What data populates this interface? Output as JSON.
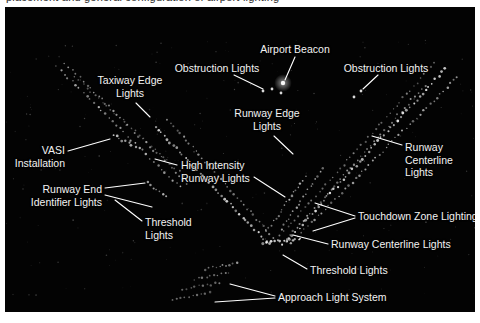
{
  "figure": {
    "top_cropped_text": "placement and general configuration of airport lighting",
    "background_color": "#ffffff",
    "photo_color": "#030303",
    "label_color": "#f2f2f2",
    "leader_color": "#ffffff"
  },
  "annotations": [
    {
      "id": "taxiway-edge-lights",
      "text": "Taxiway Edge\nLights",
      "align": "center",
      "x": 125,
      "y": 67,
      "leader": [
        [
          131,
          96
        ],
        [
          145,
          110
        ]
      ]
    },
    {
      "id": "obstruction-lights-left",
      "text": "Obstruction Lights",
      "align": "center",
      "x": 212,
      "y": 55,
      "leader": [
        [
          229,
          68
        ],
        [
          258,
          82
        ]
      ]
    },
    {
      "id": "airport-beacon",
      "text": "Airport Beacon",
      "align": "center",
      "x": 290,
      "y": 36,
      "leader": [
        [
          290,
          50
        ],
        [
          280,
          73
        ]
      ]
    },
    {
      "id": "obstruction-lights-right",
      "text": "Obstruction Lights",
      "align": "center",
      "x": 381,
      "y": 55,
      "leader": [
        [
          373,
          68
        ],
        [
          358,
          82
        ]
      ]
    },
    {
      "id": "runway-edge-lights",
      "text": "Runway Edge\nLights",
      "align": "center",
      "x": 262,
      "y": 100,
      "leader": [
        [
          269,
          129
        ],
        [
          288,
          147
        ]
      ]
    },
    {
      "id": "vasi-installation",
      "text": "VASI\nInstallation",
      "align": "right",
      "x": 60,
      "y": 137,
      "leader": [
        [
          63,
          144
        ],
        [
          105,
          132
        ]
      ]
    },
    {
      "id": "high-intensity-runway-lights",
      "text": "High Intensity\nRunway Lights",
      "align": "left",
      "x": 176,
      "y": 152,
      "leader": [
        [
          172,
          158
        ],
        [
          150,
          152
        ]
      ]
    },
    {
      "id": "high-intensity-runway-lights-right-leader",
      "text": "",
      "align": "left",
      "x": 0,
      "y": 0,
      "leader": [
        [
          249,
          170
        ],
        [
          280,
          190
        ]
      ]
    },
    {
      "id": "runway-centerline-lights-right",
      "text": "Runway\nCenterline\nLights",
      "align": "left",
      "x": 400,
      "y": 134,
      "leader": [
        [
          397,
          138
        ],
        [
          367,
          129
        ]
      ]
    },
    {
      "id": "runway-end-identifier-lights",
      "text": "Runway End\nIdentifier Lights",
      "align": "right",
      "x": 97,
      "y": 176,
      "leader": [
        [
          100,
          181
        ],
        [
          140,
          176
        ]
      ]
    },
    {
      "id": "runway-end-identifier-lights-leader2",
      "text": "",
      "align": "left",
      "x": 0,
      "y": 0,
      "leader": [
        [
          100,
          188
        ],
        [
          147,
          200
        ]
      ]
    },
    {
      "id": "threshold-lights-left",
      "text": "Threshold\nLights",
      "align": "left",
      "x": 140,
      "y": 209,
      "leader": [
        [
          137,
          214
        ],
        [
          110,
          193
        ]
      ]
    },
    {
      "id": "touchdown-zone-lighting",
      "text": "Touchdown Zone Lighting",
      "align": "left",
      "x": 353,
      "y": 203,
      "leader": [
        [
          350,
          209
        ],
        [
          310,
          196
        ]
      ]
    },
    {
      "id": "touchdown-zone-lighting-leader2",
      "text": "",
      "align": "left",
      "x": 0,
      "y": 0,
      "leader": [
        [
          350,
          211
        ],
        [
          308,
          224
        ]
      ]
    },
    {
      "id": "runway-centerline-lights-bottom",
      "text": "Runway Centerline Lights",
      "align": "left",
      "x": 326,
      "y": 231,
      "leader": [
        [
          323,
          237
        ],
        [
          288,
          228
        ]
      ]
    },
    {
      "id": "threshold-lights-bottom",
      "text": "Threshold Lights",
      "align": "left",
      "x": 305,
      "y": 257,
      "leader": [
        [
          302,
          262
        ],
        [
          278,
          248
        ]
      ]
    },
    {
      "id": "approach-light-system",
      "text": "Approach Light System",
      "align": "left",
      "x": 273,
      "y": 284,
      "leader": [
        [
          270,
          289
        ],
        [
          225,
          277
        ]
      ]
    },
    {
      "id": "approach-light-system-leader2",
      "text": "",
      "align": "left",
      "x": 0,
      "y": 0,
      "leader": [
        [
          270,
          291
        ],
        [
          210,
          295
        ]
      ]
    }
  ],
  "scene": {
    "description": "Night aerial photograph of an airport showing runway and taxiway lighting",
    "light_runs": [
      {
        "id": "taxiway-edge-run-a",
        "x1": 52,
        "y1": 60,
        "x2": 175,
        "y2": 180,
        "count": 34,
        "size": 1.05,
        "alpha": 0.72
      },
      {
        "id": "taxiway-edge-run-b",
        "x1": 60,
        "y1": 56,
        "x2": 182,
        "y2": 176,
        "count": 34,
        "size": 0.95,
        "alpha": 0.6
      },
      {
        "id": "taxiway-edge-run-c",
        "x1": 70,
        "y1": 70,
        "x2": 178,
        "y2": 168,
        "count": 28,
        "size": 0.85,
        "alpha": 0.45
      },
      {
        "id": "runway-left-edge",
        "x1": 150,
        "y1": 120,
        "x2": 262,
        "y2": 235,
        "count": 38,
        "size": 1.1,
        "alpha": 0.82
      },
      {
        "id": "runway-left-edge-2",
        "x1": 162,
        "y1": 112,
        "x2": 268,
        "y2": 230,
        "count": 34,
        "size": 0.95,
        "alpha": 0.6
      },
      {
        "id": "runway-right-edge",
        "x1": 440,
        "y1": 62,
        "x2": 278,
        "y2": 238,
        "count": 52,
        "size": 1.15,
        "alpha": 0.88
      },
      {
        "id": "runway-right-edge-2",
        "x1": 452,
        "y1": 70,
        "x2": 286,
        "y2": 236,
        "count": 50,
        "size": 1.0,
        "alpha": 0.66
      },
      {
        "id": "runway-right-edge-3",
        "x1": 430,
        "y1": 56,
        "x2": 272,
        "y2": 232,
        "count": 46,
        "size": 0.9,
        "alpha": 0.5
      },
      {
        "id": "runway-centerline-right",
        "x1": 420,
        "y1": 78,
        "x2": 282,
        "y2": 232,
        "count": 42,
        "size": 0.95,
        "alpha": 0.6
      },
      {
        "id": "touchdown-zone-a",
        "x1": 300,
        "y1": 170,
        "x2": 262,
        "y2": 224,
        "count": 18,
        "size": 1.0,
        "alpha": 0.7
      },
      {
        "id": "touchdown-zone-b",
        "x1": 318,
        "y1": 162,
        "x2": 276,
        "y2": 222,
        "count": 18,
        "size": 1.0,
        "alpha": 0.66
      },
      {
        "id": "threshold-bar",
        "x1": 258,
        "y1": 236,
        "x2": 296,
        "y2": 232,
        "count": 14,
        "size": 1.2,
        "alpha": 0.9
      },
      {
        "id": "approach-bar-1",
        "x1": 200,
        "y1": 262,
        "x2": 232,
        "y2": 256,
        "count": 10,
        "size": 1.0,
        "alpha": 0.6
      },
      {
        "id": "approach-bar-2",
        "x1": 190,
        "y1": 272,
        "x2": 224,
        "y2": 266,
        "count": 10,
        "size": 1.0,
        "alpha": 0.55
      },
      {
        "id": "approach-bar-3",
        "x1": 178,
        "y1": 282,
        "x2": 214,
        "y2": 276,
        "count": 10,
        "size": 1.0,
        "alpha": 0.5
      },
      {
        "id": "approach-bar-4",
        "x1": 168,
        "y1": 292,
        "x2": 204,
        "y2": 286,
        "count": 10,
        "size": 1.0,
        "alpha": 0.45
      },
      {
        "id": "vasi-cluster",
        "x1": 108,
        "y1": 128,
        "x2": 130,
        "y2": 140,
        "count": 8,
        "size": 1.1,
        "alpha": 0.75
      },
      {
        "id": "reil-cluster",
        "x1": 142,
        "y1": 176,
        "x2": 162,
        "y2": 190,
        "count": 7,
        "size": 1.1,
        "alpha": 0.7
      }
    ],
    "beacon": {
      "x": 278,
      "y": 76,
      "radius": 2.2
    },
    "obstruction_points": [
      {
        "x": 258,
        "y": 84
      },
      {
        "x": 267,
        "y": 82
      },
      {
        "x": 276,
        "y": 86
      },
      {
        "x": 356,
        "y": 84
      },
      {
        "x": 349,
        "y": 90
      }
    ]
  }
}
